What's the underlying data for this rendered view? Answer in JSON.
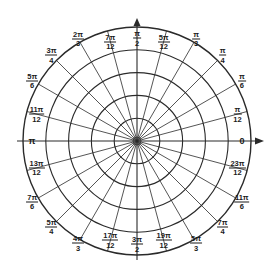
{
  "diagram": {
    "center": [
      137,
      141
    ],
    "outer_radius": 114,
    "ring_count": 5,
    "inner_hub_radius": 4,
    "spoke_step_deg": 15,
    "colors": {
      "line": "#2a2a2a",
      "background": "#ffffff",
      "text": "#1a1a1a"
    },
    "axis_arrows": [
      "up",
      "right"
    ],
    "labels": [
      {
        "angle": 0,
        "num": "0",
        "den": "",
        "plain": true,
        "r": 105
      },
      {
        "angle": 15,
        "num": "π",
        "den": "12",
        "r": 104
      },
      {
        "angle": 30,
        "num": "π",
        "den": "6",
        "r": 121
      },
      {
        "angle": 45,
        "num": "π",
        "den": "4",
        "r": 121
      },
      {
        "angle": 60,
        "num": "π",
        "den": "3",
        "r": 118
      },
      {
        "angle": 75,
        "num": "5π",
        "den": "12",
        "r": 103
      },
      {
        "angle": 90,
        "num": "π",
        "den": "2",
        "r": 103
      },
      {
        "angle": 105,
        "num": "7π",
        "den": "12",
        "r": 103
      },
      {
        "angle": 120,
        "num": "2π",
        "den": "3",
        "r": 118
      },
      {
        "angle": 135,
        "num": "3π",
        "den": "4",
        "r": 121
      },
      {
        "angle": 150,
        "num": "5π",
        "den": "6",
        "r": 121
      },
      {
        "angle": 165,
        "num": "11π",
        "den": "12",
        "r": 104
      },
      {
        "angle": 180,
        "num": "π",
        "den": "",
        "plain": true,
        "r": 105
      },
      {
        "angle": 195,
        "num": "13π",
        "den": "12",
        "r": 104
      },
      {
        "angle": 210,
        "num": "7π",
        "den": "6",
        "r": 121
      },
      {
        "angle": 225,
        "num": "5π",
        "den": "4",
        "r": 121
      },
      {
        "angle": 240,
        "num": "4π",
        "den": "3",
        "r": 118
      },
      {
        "angle": 255,
        "num": "17π",
        "den": "12",
        "r": 103
      },
      {
        "angle": 270,
        "num": "3π",
        "den": "2",
        "r": 103
      },
      {
        "angle": 285,
        "num": "19π",
        "den": "12",
        "r": 103
      },
      {
        "angle": 300,
        "num": "5π",
        "den": "3",
        "r": 118
      },
      {
        "angle": 315,
        "num": "7π",
        "den": "4",
        "r": 121
      },
      {
        "angle": 330,
        "num": "11π",
        "den": "6",
        "r": 121
      },
      {
        "angle": 345,
        "num": "23π",
        "den": "12",
        "r": 104
      }
    ]
  }
}
